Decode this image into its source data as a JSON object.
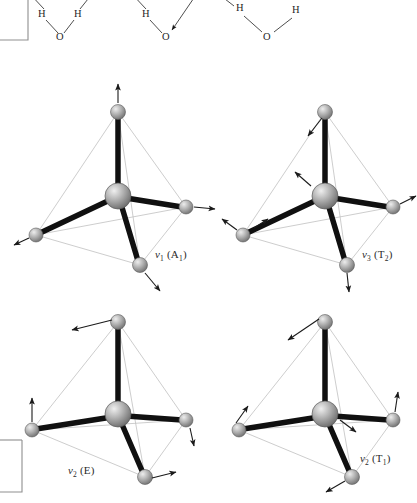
{
  "figure": {
    "background_color": "#ffffff",
    "line_color": "#1a1a1a",
    "edge_color": "#b9b9b9",
    "bond_color": "#111111",
    "atom_fill": "#a8a8a8",
    "atom_highlight": "#e6e6e6",
    "atom_shadow": "#6f6f6f"
  },
  "top_panel": {
    "description": "Partial water molecule diagrams cropped at the top edge",
    "molecules": [
      {
        "id": "water-left",
        "atoms": [
          {
            "label": "H",
            "x": 42,
            "y": 14
          },
          {
            "label": "H",
            "x": 78,
            "y": 14
          },
          {
            "label": "O",
            "x": 60,
            "y": 38
          }
        ]
      },
      {
        "id": "water-middle",
        "atoms": [
          {
            "label": "H",
            "x": 146,
            "y": 14
          },
          {
            "label": "O",
            "x": 166,
            "y": 38
          }
        ]
      },
      {
        "id": "water-right",
        "atoms": [
          {
            "label": "H",
            "x": 240,
            "y": 8
          },
          {
            "label": "H",
            "x": 296,
            "y": 10
          },
          {
            "label": "O",
            "x": 267,
            "y": 38
          }
        ]
      }
    ]
  },
  "panels": [
    {
      "id": "panel-nu1-a1",
      "position": "top-left",
      "mode_symbol": "ν",
      "mode_index": "1",
      "symmetry": "(A",
      "symmetry_sub": "1",
      "symmetry_close": ")",
      "label_text": "ν₁ (A₁)",
      "label_x": 155,
      "label_y": 248,
      "mode_type": "symmetric stretch"
    },
    {
      "id": "panel-nu3-t2",
      "position": "top-right",
      "mode_symbol": "ν",
      "mode_index": "3",
      "symmetry": "(T",
      "symmetry_sub": "2",
      "symmetry_close": ")",
      "label_text": "ν₃ (T₂)",
      "label_x": 362,
      "label_y": 248,
      "mode_type": "asymmetric stretch"
    },
    {
      "id": "panel-nu2-e",
      "position": "bottom-left",
      "mode_symbol": "ν",
      "mode_index": "2",
      "symmetry": "(E",
      "symmetry_sub": "",
      "symmetry_close": ")",
      "label_text": "ν₂ (E)",
      "label_x": 68,
      "label_y": 464,
      "mode_type": "bend"
    },
    {
      "id": "panel-nu2-t1",
      "position": "bottom-right",
      "mode_symbol": "ν",
      "mode_index": "2",
      "symmetry": "(T",
      "symmetry_sub": "1",
      "symmetry_close": ")",
      "label_text": "ν₂ (T₁)",
      "label_x": 360,
      "label_y": 452,
      "mode_type": "bend"
    }
  ]
}
